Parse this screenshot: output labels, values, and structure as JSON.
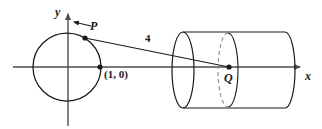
{
  "figure": {
    "colors": {
      "stroke": "#1a1a1a",
      "axis": "#4d4d4d",
      "dashed": "#8c8c8c",
      "background": "#ffffff"
    },
    "axes": {
      "x_label": "x",
      "y_label": "y",
      "x_axis_start_px": 13,
      "x_axis_end_px": 305,
      "x_axis_y_px": 67,
      "y_axis_top_px": 9,
      "y_axis_bottom_px": 126,
      "y_axis_x_px": 68
    },
    "circle": {
      "center_px": [
        67,
        67
      ],
      "radius_px": 34,
      "description": "unit circle centered at the origin"
    },
    "points": [
      {
        "name": "P",
        "label": "P",
        "px": [
          85,
          38
        ],
        "note": "point on the circle, marked with a leader arrow"
      },
      {
        "name": "intercept",
        "label": "(1, 0)",
        "px": [
          100,
          67
        ],
        "note": "x-intercept of the unit circle"
      },
      {
        "name": "Q",
        "label": "Q",
        "px": [
          229,
          67
        ],
        "note": "center point inside the cylinder on the x-axis"
      }
    ],
    "segment": {
      "label": "4",
      "from": "P",
      "to": "Q",
      "note": "segment length annotation"
    },
    "cylinder": {
      "left_cap_center_px": [
        183,
        70
      ],
      "left_cap_rx": 11,
      "left_cap_ry": 38,
      "mid_ellipse_center_px": [
        228,
        70
      ],
      "mid_ellipse_rx": 10,
      "mid_ellipse_ry": 37,
      "right_cap_center_px": [
        285,
        70
      ],
      "right_cap_rx": 10,
      "right_cap_ry": 38,
      "note": "horizontal cylinder drawn in perspective with a dashed interior cross-section ellipse"
    }
  }
}
